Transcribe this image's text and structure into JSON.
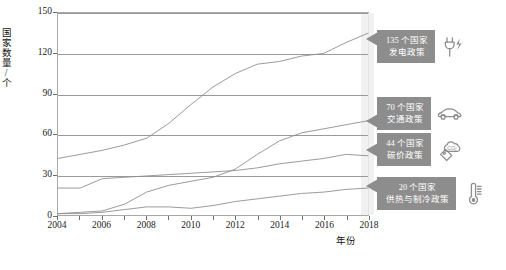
{
  "chart_data": {
    "type": "line",
    "title": "",
    "xlabel": "年份",
    "ylabel": "国家数量/个",
    "xlim": [
      2004,
      2018
    ],
    "ylim": [
      0,
      150
    ],
    "grid": true,
    "legend_position": "right-callouts",
    "x": [
      2004,
      2005,
      2006,
      2007,
      2008,
      2009,
      2010,
      2011,
      2012,
      2013,
      2014,
      2015,
      2016,
      2017,
      2018
    ],
    "yticks": [
      0,
      30,
      60,
      90,
      120,
      150
    ],
    "xticks": [
      2004,
      2006,
      2008,
      2010,
      2012,
      2014,
      2016,
      2018
    ],
    "xtick_labels": [
      "2004",
      "2006",
      "2008",
      "2010",
      "2012",
      "2014",
      "2016",
      "2018"
    ],
    "ytick_labels": [
      "0",
      "30",
      "60",
      "90",
      "120",
      "150"
    ],
    "highlight_year": 2018,
    "series": [
      {
        "name": "发电政策",
        "end_value": 135,
        "values": [
          42,
          45,
          48,
          52,
          57,
          68,
          82,
          95,
          105,
          112,
          114,
          118,
          120,
          128,
          135
        ]
      },
      {
        "name": "交通政策",
        "end_value": 70,
        "values": [
          1,
          2,
          3,
          8,
          17,
          22,
          25,
          28,
          34,
          45,
          55,
          61,
          64,
          67,
          70
        ]
      },
      {
        "name": "碳价政策",
        "end_value": 44,
        "values": [
          20,
          20,
          27,
          28,
          29,
          30,
          31,
          32,
          33,
          35,
          38,
          40,
          42,
          45,
          44
        ]
      },
      {
        "name": "供热与制冷政策",
        "end_value": 20,
        "values": [
          1,
          1,
          2,
          4,
          6,
          6,
          5,
          7,
          10,
          12,
          14,
          16,
          17,
          19,
          20
        ]
      }
    ]
  },
  "callouts": [
    {
      "id": "power",
      "line1": "135 个国家",
      "line2": "发电政策",
      "icon": "plug-lightning-icon"
    },
    {
      "id": "transport",
      "line1": "70 个国家",
      "line2": "交通政策",
      "icon": "car-icon"
    },
    {
      "id": "carbon-price",
      "line1": "44 个国家",
      "line2": "碳价政策",
      "icon": "co2-tag-icon"
    },
    {
      "id": "heating-cooling",
      "line1": "20 个国家",
      "line2": "供热与制冷政策",
      "icon": "thermometer-icon"
    }
  ],
  "colors": {
    "callout_bg": "#8d8d8d",
    "callout_text": "#ffffff",
    "grid": "#9a9a9a",
    "axis": "#a8a8a8",
    "line": "#8f8f8f",
    "highlight_band": "#eeeeee",
    "background": "#ffffff"
  }
}
